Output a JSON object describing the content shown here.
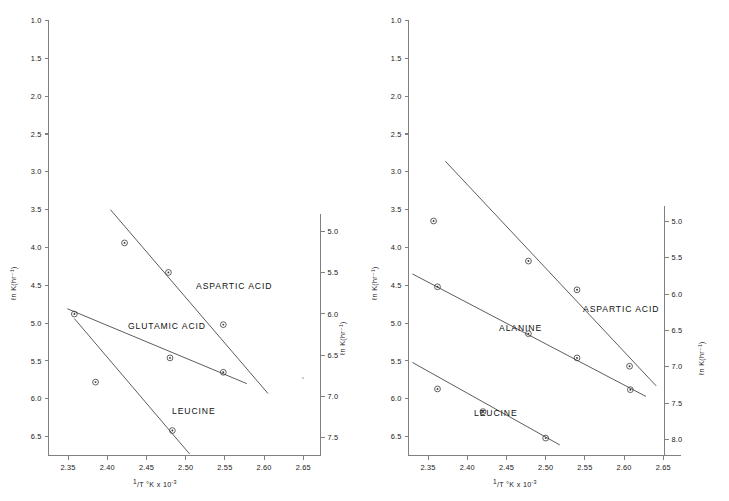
{
  "figure": {
    "background": "#ffffff",
    "line_color": "#4a4a4a",
    "axis_color": "#808080",
    "marker_color": "#3a3a3a"
  },
  "axis_titles": {
    "y": "ℓn K(hr⁻¹)",
    "x_prefix": "1",
    "x_rest": "/T °K x 10",
    "x_exp": "-3"
  },
  "panels": [
    {
      "id": "left",
      "x_ticks": [
        "2.35",
        "2.40",
        "2.45",
        "2.50",
        "2.55",
        "2.60",
        "2.65"
      ],
      "y_left_ticks": [
        "1.0",
        "1.5",
        "2.0",
        "2.5",
        "3.0",
        "3.5",
        "4.0",
        "4.5",
        "5.0",
        "5.5",
        "6.0",
        "6.5"
      ],
      "y_right_ticks": [
        "5.0",
        "5.5",
        "6.0",
        "6.5",
        "7.0",
        "7.5"
      ],
      "series_labels": [
        "ASPARTIC ACID",
        "GLUTAMIC ACID",
        "LEUCINE"
      ]
    },
    {
      "id": "right",
      "x_ticks": [
        "2.35",
        "2.40",
        "2.45",
        "2.50",
        "2.55",
        "2.60",
        "2.65"
      ],
      "y_left_ticks": [
        "1.0",
        "1.5",
        "2.0",
        "2.5",
        "3.0",
        "3.5",
        "4.0",
        "4.5",
        "5.0",
        "5.5",
        "6.0",
        "6.5"
      ],
      "y_right_ticks": [
        "5.0",
        "5.5",
        "6.0",
        "6.5",
        "7.0",
        "7.5",
        "8.0"
      ],
      "series_labels": [
        "ASPARTIC ACID",
        "ALANINE",
        "LEUCINE"
      ]
    }
  ],
  "chart_data": [
    {
      "type": "scatter",
      "panel": "left",
      "title": "",
      "xlabel": "1/T °K x 10^-3",
      "ylabel": "ℓn K(hr⁻¹)",
      "xlim": [
        2.325,
        2.672
      ],
      "ylim_left": [
        1.0,
        6.75
      ],
      "y_inverted": true,
      "ylim_right": [
        4.78,
        7.72
      ],
      "grid": false,
      "legend": "inline-annotations",
      "series": [
        {
          "name": "ASPARTIC ACID",
          "axis": "left",
          "points": [
            {
              "x": 2.422,
              "y": 3.94
            },
            {
              "x": 2.478,
              "y": 4.33
            },
            {
              "x": 2.548,
              "y": 5.02
            }
          ],
          "fit_line": {
            "x1": 2.404,
            "y1": 3.5,
            "x2": 2.605,
            "y2": 5.93
          }
        },
        {
          "name": "GLUTAMIC ACID",
          "axis": "left",
          "points": [
            {
              "x": 2.358,
              "y": 4.88
            },
            {
              "x": 2.48,
              "y": 5.46
            },
            {
              "x": 2.548,
              "y": 5.65
            }
          ],
          "fit_line": {
            "x1": 2.349,
            "y1": 4.81,
            "x2": 2.578,
            "y2": 5.8
          }
        },
        {
          "name": "LEUCINE",
          "axis": "left",
          "points": [
            {
              "x": 2.385,
              "y": 5.78
            },
            {
              "x": 2.483,
              "y": 6.42
            }
          ],
          "fit_line": {
            "x1": 2.358,
            "y1": 4.94,
            "x2": 2.505,
            "y2": 6.73
          }
        }
      ]
    },
    {
      "type": "scatter",
      "panel": "right",
      "title": "",
      "xlabel": "1/T °K x 10^-3",
      "ylabel": "ℓn K(hr⁻¹)",
      "xlim": [
        2.325,
        2.672
      ],
      "ylim_left": [
        1.0,
        6.75
      ],
      "y_inverted": true,
      "ylim_right": [
        4.78,
        8.22
      ],
      "grid": false,
      "legend": "inline-annotations",
      "series": [
        {
          "name": "ASPARTIC ACID",
          "axis": "left",
          "points": [
            {
              "x": 2.478,
              "y": 4.18
            },
            {
              "x": 2.54,
              "y": 4.56
            },
            {
              "x": 2.607,
              "y": 5.57
            },
            {
              "x": 2.357,
              "y": 3.65,
              "outlier": true
            }
          ],
          "fit_line": {
            "x1": 2.372,
            "y1": 2.86,
            "x2": 2.641,
            "y2": 5.83
          }
        },
        {
          "name": "ALANINE",
          "axis": "left",
          "points": [
            {
              "x": 2.362,
              "y": 4.52
            },
            {
              "x": 2.478,
              "y": 5.14
            },
            {
              "x": 2.54,
              "y": 5.46
            },
            {
              "x": 2.608,
              "y": 5.88
            }
          ],
          "fit_line": {
            "x1": 2.33,
            "y1": 4.35,
            "x2": 2.628,
            "y2": 5.97
          }
        },
        {
          "name": "LEUCINE",
          "axis": "left",
          "points": [
            {
              "x": 2.362,
              "y": 5.87
            },
            {
              "x": 2.42,
              "y": 6.17
            },
            {
              "x": 2.5,
              "y": 6.52
            }
          ],
          "fit_line": {
            "x1": 2.33,
            "y1": 5.52,
            "x2": 2.518,
            "y2": 6.61
          }
        }
      ]
    }
  ]
}
